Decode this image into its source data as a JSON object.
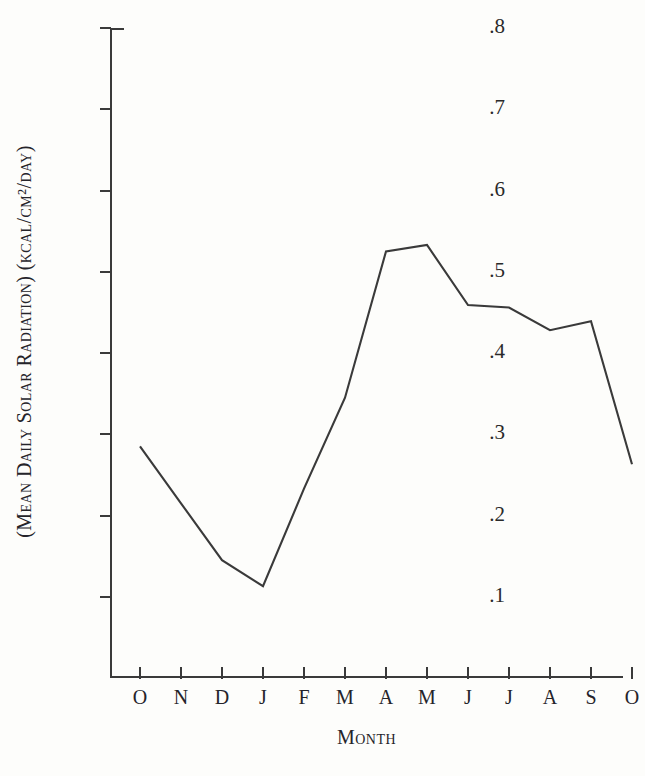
{
  "chart_data": {
    "type": "line",
    "title": "",
    "subtitle": "",
    "xlabel": "Month",
    "ylabel": "(Mean Daily Solar Radiation) (kcal/cm²/day)",
    "categories": [
      "O",
      "N",
      "D",
      "J",
      "F",
      "M",
      "A",
      "M",
      "J",
      "J",
      "A",
      "S",
      "O"
    ],
    "values": [
      0.285,
      0.215,
      0.145,
      0.113,
      0.233,
      0.345,
      0.525,
      0.533,
      0.459,
      0.456,
      0.428,
      0.439,
      0.263
    ],
    "series": [
      {
        "name": "Mean Daily Solar Radiation",
        "values": [
          0.285,
          0.215,
          0.145,
          0.113,
          0.233,
          0.345,
          0.525,
          0.533,
          0.459,
          0.456,
          0.428,
          0.439,
          0.263
        ]
      }
    ],
    "ylim": [
      0.0,
      0.8
    ],
    "xlim": [
      0,
      12
    ],
    "ytick_labels": [
      ".1",
      ".2",
      ".3",
      ".4",
      ".5",
      ".6",
      ".7",
      ".8"
    ],
    "ytick_values": [
      0.1,
      0.2,
      0.3,
      0.4,
      0.5,
      0.6,
      0.7,
      0.8
    ],
    "xtick_labels": [
      "O",
      "N",
      "D",
      "J",
      "F",
      "M",
      "A",
      "M",
      "J",
      "J",
      "A",
      "S",
      "O"
    ],
    "grid": false,
    "legend": "none",
    "markers": "none",
    "line_color": "#3a3a3a",
    "axis_color": "#3a3a3a",
    "background_color": "#fdfdfb"
  },
  "axes": {
    "y_title": "(Mean Daily Solar Radiation)  (kcal/cm²/day)",
    "x_title": "Month"
  }
}
